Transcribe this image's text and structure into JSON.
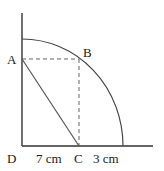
{
  "diagram": {
    "type": "geometry-quarter-circle",
    "points": {
      "A": {
        "label": "A"
      },
      "B": {
        "label": "B"
      },
      "C": {
        "label": "C"
      },
      "D": {
        "label": "D"
      }
    },
    "measurements": {
      "DC": "7 cm",
      "C_to_arc": "3 cm"
    },
    "colors": {
      "axis": "#333333",
      "arc": "#444444",
      "dashed": "#666666",
      "segment": "#555555"
    }
  }
}
